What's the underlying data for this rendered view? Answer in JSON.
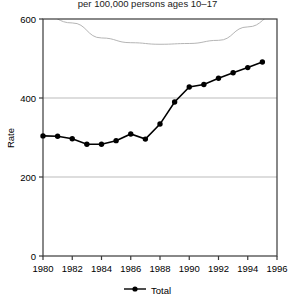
{
  "chart_data": {
    "type": "line",
    "title": "per 100,000 persons ages 10–17",
    "xlabel": "",
    "ylabel": "Rate",
    "xlim": [
      1980,
      1996
    ],
    "ylim": [
      0,
      600
    ],
    "yticks": [
      0,
      200,
      400,
      600
    ],
    "ytick_labels": [
      "0",
      "200",
      "400",
      "600"
    ],
    "xticks": [
      1980,
      1982,
      1984,
      1986,
      1988,
      1990,
      1992,
      1994,
      1996
    ],
    "xtick_labels": [
      "1980",
      "1982",
      "1984",
      "1986",
      "1988",
      "1990",
      "1992",
      "1994",
      "1996"
    ],
    "grid": "horizontal",
    "legend_position": "bottom",
    "series": [
      {
        "name": "Total",
        "marker": "filled-circle",
        "color": "#000000",
        "x": [
          1980,
          1981,
          1982,
          1983,
          1984,
          1985,
          1986,
          1987,
          1988,
          1989,
          1990,
          1991,
          1992,
          1993,
          1994,
          1995
        ],
        "values": [
          304,
          303,
          297,
          283,
          283,
          292,
          309,
          296,
          334,
          390,
          428,
          434,
          450,
          464,
          477,
          491
        ]
      },
      {
        "name": "background-curve",
        "color": "#b0b0b0",
        "x": [
          1980,
          1982,
          1984,
          1986,
          1988,
          1990,
          1992,
          1994,
          1996
        ],
        "values": [
          610,
          590,
          552,
          540,
          536,
          538,
          546,
          580,
          612
        ]
      }
    ]
  },
  "legend": {
    "entries": [
      {
        "label": "Total",
        "marker": "filled-circle",
        "color": "#000000"
      }
    ]
  }
}
